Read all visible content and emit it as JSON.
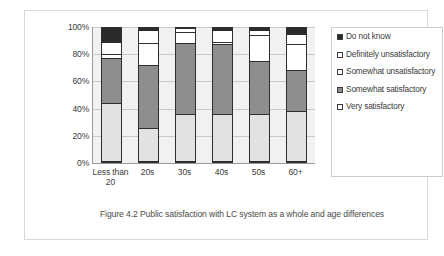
{
  "caption": "Figure 4.2 Public satisfaction with LC system as a whole and age differences",
  "legend": {
    "items": [
      {
        "label": "Do not know",
        "swatch_color": "#2b2b2b",
        "icon": "square-filled-icon"
      },
      {
        "label": "Definitely unsatisfactory",
        "swatch_color": "#ffffff",
        "icon": "square-outline-icon"
      },
      {
        "label": "Somewhat unsatisfactory",
        "swatch_color": "#ffffff",
        "icon": "square-outline-icon"
      },
      {
        "label": "Somewhat satisfactory",
        "swatch_color": "#8e8e8e",
        "icon": "square-filled-icon"
      },
      {
        "label": "Very satisfactory",
        "swatch_color": "#ffffff",
        "icon": "square-outline-icon"
      }
    ]
  },
  "chart_data": {
    "type": "bar",
    "stacked": true,
    "normalized": "100%",
    "title": "",
    "xlabel": "",
    "ylabel": "",
    "ylim": [
      0,
      100
    ],
    "yticks": [
      "0%",
      "20%",
      "40%",
      "60%",
      "80%",
      "100%"
    ],
    "grid": true,
    "legend_position": "right",
    "categories": [
      "Less than 20",
      "20s",
      "30s",
      "40s",
      "50s",
      "60+"
    ],
    "series": [
      {
        "name": "Very satisfactory",
        "color": "#e2e2e2",
        "values": [
          43,
          25,
          35,
          35,
          35,
          37
        ]
      },
      {
        "name": "Somewhat satisfactory",
        "color": "#8e8e8e",
        "values": [
          34,
          47,
          53,
          52,
          40,
          31
        ]
      },
      {
        "name": "Somewhat unsatisfactory",
        "color": "#ffffff",
        "values": [
          3,
          16,
          8,
          2,
          19,
          19
        ]
      },
      {
        "name": "Definitely unsatisfactory",
        "color": "#ffffff",
        "values": [
          9,
          10,
          3,
          9,
          4,
          8
        ]
      },
      {
        "name": "Do not know",
        "color": "#2b2b2b",
        "values": [
          11,
          2,
          1,
          2,
          2,
          5
        ]
      }
    ]
  }
}
